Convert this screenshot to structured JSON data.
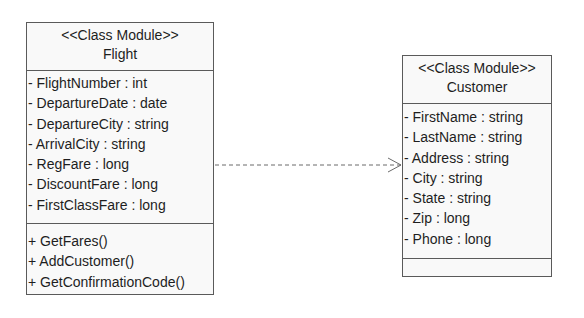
{
  "diagram": {
    "type": "UML class diagram",
    "classes": [
      {
        "id": "flight",
        "stereotype": "<<Class Module>>",
        "name": "Flight",
        "attributes": [
          "- FlightNumber : int",
          "- DepartureDate : date",
          "- DepartureCity : string",
          "- ArrivalCity : string",
          "- RegFare : long",
          "- DiscountFare : long",
          "- FirstClassFare : long"
        ],
        "operations": [
          "+ GetFares()",
          "+ AddCustomer()",
          "+ GetConfirmationCode()"
        ]
      },
      {
        "id": "customer",
        "stereotype": "<<Class Module>>",
        "name": "Customer",
        "attributes": [
          "- FirstName : string",
          "- LastName : string",
          "- Address : string",
          "- City : string",
          "- State : string",
          "- Zip : long",
          "- Phone : long"
        ],
        "operations": []
      }
    ],
    "relationships": [
      {
        "from": "Flight",
        "to": "Customer",
        "kind": "dependency",
        "line_style": "dashed",
        "arrowhead": "open"
      }
    ]
  },
  "colors": {
    "background": "#ffffff",
    "box_fill": "#f9f9f9",
    "border": "#5a5a5a",
    "text": "#1e1e1e",
    "connector": "#6a6a6a"
  }
}
